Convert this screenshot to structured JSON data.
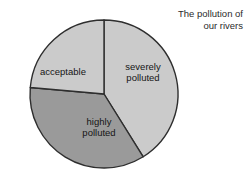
{
  "title": {
    "line1": "The pollution of",
    "line2": "our rivers",
    "full": "The pollution of\nour rivers"
  },
  "labels": {
    "severely_polluted": "severely\npolluted",
    "highly_polluted": "highly\npolluted",
    "acceptable": "acceptable"
  },
  "colors": {
    "background": "#ffffff",
    "outline": "#2e2e2e",
    "light_gray": "#cbcbcb",
    "dark_gray": "#9a9a9a",
    "text": "#151515",
    "title_text": "#2b2b2b"
  },
  "geometry": {
    "center_x": 104,
    "center_y": 94,
    "radius": 74
  },
  "chart_data": {
    "type": "pie",
    "title": "The pollution of our rivers",
    "categories": [
      "severely polluted",
      "highly polluted",
      "acceptable"
    ],
    "values": [
      41,
      35,
      24
    ],
    "units": "percent",
    "start_angle_deg": 0,
    "direction": "clockwise",
    "slices": [
      {
        "label": "severely polluted",
        "value": 41,
        "start_angle_deg": 0,
        "end_angle_deg": 148,
        "color": "#cbcbcb",
        "label_x": 143,
        "label_y": 72
      },
      {
        "label": "highly polluted",
        "value": 35,
        "start_angle_deg": 148,
        "end_angle_deg": 275,
        "color": "#9a9a9a",
        "label_x": 99,
        "label_y": 127
      },
      {
        "label": "acceptable",
        "value": 24,
        "start_angle_deg": 275,
        "end_angle_deg": 360,
        "color": "#cbcbcb",
        "label_x": 63,
        "label_y": 71
      }
    ],
    "legend": "none",
    "grid": false,
    "xlabel": "",
    "ylabel": ""
  }
}
